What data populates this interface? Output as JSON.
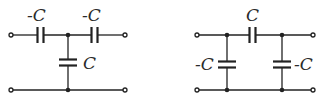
{
  "diagram": {
    "type": "capacitor-networks",
    "circuits": [
      {
        "name": "T-network",
        "capacitors": [
          {
            "position": "series-left",
            "label": "-C"
          },
          {
            "position": "series-right",
            "label": "-C"
          },
          {
            "position": "shunt-middle",
            "label": "C"
          }
        ]
      },
      {
        "name": "Pi-network",
        "capacitors": [
          {
            "position": "series-top",
            "label": "C"
          },
          {
            "position": "shunt-left",
            "label": "-C"
          },
          {
            "position": "shunt-right",
            "label": "-C"
          }
        ]
      }
    ]
  }
}
